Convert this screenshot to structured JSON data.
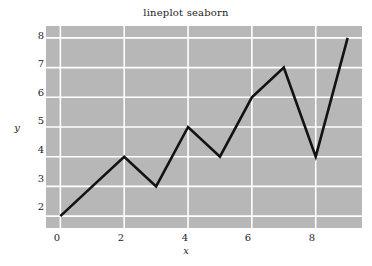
{
  "chart_data": {
    "type": "line",
    "title": "lineplot seaborn",
    "xlabel": "x",
    "ylabel": "y",
    "x": [
      0,
      1,
      2,
      3,
      4,
      5,
      6,
      7,
      8,
      9
    ],
    "values": [
      2,
      3,
      4,
      3,
      5,
      4,
      6,
      7,
      4,
      8
    ],
    "series": [
      {
        "name": "line",
        "x": [
          0,
          1,
          2,
          3,
          4,
          5,
          6,
          7,
          8,
          9
        ],
        "values": [
          2,
          3,
          4,
          3,
          5,
          4,
          6,
          7,
          4,
          8
        ]
      }
    ],
    "xlim": [
      -0.45,
      9.45
    ],
    "ylim": [
      1.6,
      8.4
    ],
    "xticks": [
      0,
      2,
      4,
      6,
      8
    ],
    "yticks": [
      2,
      3,
      4,
      5,
      6,
      7,
      8
    ],
    "xtick_labels": [
      "0",
      "2",
      "4",
      "6",
      "8"
    ],
    "ytick_labels": [
      "2",
      "3",
      "4",
      "5",
      "6",
      "7",
      "8"
    ],
    "grid": true,
    "legend": null,
    "line_color": "#121212",
    "line_width": 2.6,
    "plot_background": "#b7b7b7",
    "grid_color": "#ffffff",
    "figure_background": "#ffffff"
  }
}
